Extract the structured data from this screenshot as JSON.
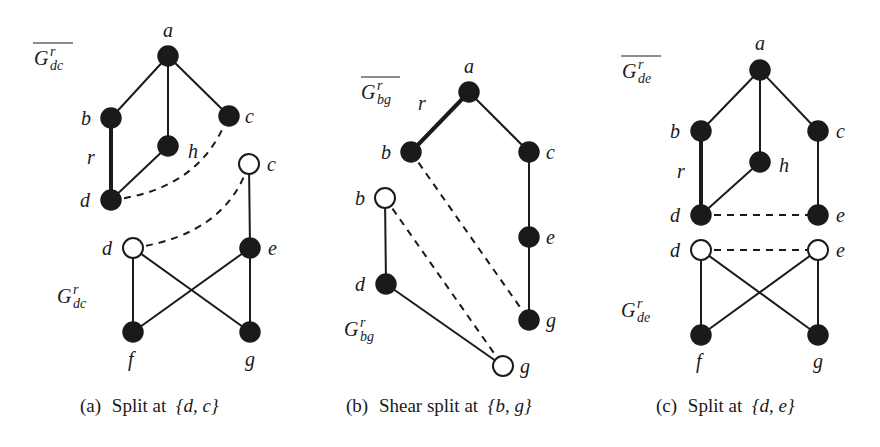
{
  "figure": {
    "panels": [
      {
        "id": "a",
        "caption_prefix": "(a)",
        "caption_text": "Split at",
        "caption_set": "{d, c}",
        "upper_graph_label": "G",
        "upper_graph_sup": "r",
        "upper_graph_sub": "dc",
        "upper_graph_overline": true,
        "lower_graph_label": "G",
        "lower_graph_sup": "r",
        "lower_graph_sub": "dc",
        "nodes": [
          {
            "name": "a",
            "style": "filled"
          },
          {
            "name": "b",
            "style": "filled"
          },
          {
            "name": "c",
            "style": "filled"
          },
          {
            "name": "h",
            "style": "filled"
          },
          {
            "name": "d",
            "style": "filled"
          },
          {
            "name": "c",
            "style": "open"
          },
          {
            "name": "d",
            "style": "open"
          },
          {
            "name": "e",
            "style": "filled"
          },
          {
            "name": "f",
            "style": "filled"
          },
          {
            "name": "g",
            "style": "filled"
          }
        ],
        "edge_label": "r"
      },
      {
        "id": "b",
        "caption_prefix": "(b)",
        "caption_text": "Shear split at",
        "caption_set": "{b, g}",
        "upper_graph_label": "G",
        "upper_graph_sup": "r",
        "upper_graph_sub": "bg",
        "upper_graph_overline": true,
        "lower_graph_label": "G",
        "lower_graph_sup": "r",
        "lower_graph_sub": "bg",
        "nodes": [
          {
            "name": "a",
            "style": "filled"
          },
          {
            "name": "b",
            "style": "filled"
          },
          {
            "name": "c",
            "style": "filled"
          },
          {
            "name": "e",
            "style": "filled"
          },
          {
            "name": "g",
            "style": "filled"
          },
          {
            "name": "b",
            "style": "open"
          },
          {
            "name": "d",
            "style": "filled"
          },
          {
            "name": "g",
            "style": "open"
          }
        ],
        "edge_label": "r"
      },
      {
        "id": "c",
        "caption_prefix": "(c)",
        "caption_text": "Split at",
        "caption_set": "{d, e}",
        "upper_graph_label": "G",
        "upper_graph_sup": "r",
        "upper_graph_sub": "de",
        "upper_graph_overline": true,
        "lower_graph_label": "G",
        "lower_graph_sup": "r",
        "lower_graph_sub": "de",
        "nodes": [
          {
            "name": "a",
            "style": "filled"
          },
          {
            "name": "b",
            "style": "filled"
          },
          {
            "name": "c",
            "style": "filled"
          },
          {
            "name": "h",
            "style": "filled"
          },
          {
            "name": "d",
            "style": "filled"
          },
          {
            "name": "e",
            "style": "filled"
          },
          {
            "name": "d",
            "style": "open"
          },
          {
            "name": "e",
            "style": "open"
          },
          {
            "name": "f",
            "style": "filled"
          },
          {
            "name": "g",
            "style": "filled"
          }
        ],
        "edge_label": "r"
      }
    ],
    "colors": {
      "ink": "#1a1a1a",
      "background": "#ffffff"
    }
  }
}
